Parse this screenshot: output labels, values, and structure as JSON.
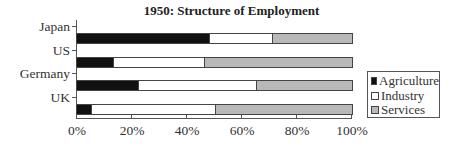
{
  "chart_data": {
    "type": "bar",
    "orientation": "horizontal",
    "stacked": "percent",
    "title": "1950:  Structure of Employment",
    "categories": [
      "Japan",
      "US",
      "Germany",
      "UK"
    ],
    "series": [
      {
        "name": "Agriculture",
        "color": "#111111",
        "values": [
          48,
          13,
          22,
          5
        ]
      },
      {
        "name": "Industry",
        "color": "#ffffff",
        "values": [
          23,
          33,
          43,
          45
        ]
      },
      {
        "name": "Services",
        "color": "#b8b8b8",
        "values": [
          29,
          54,
          35,
          50
        ]
      }
    ],
    "xlabel": "",
    "ylabel": "",
    "xlim": [
      0,
      100
    ],
    "xticks": [
      "0%",
      "20%",
      "40%",
      "60%",
      "80%",
      "100%"
    ],
    "grid": false,
    "legend_position": "right"
  },
  "title": "1950:  Structure of Employment",
  "categories": [
    "Japan",
    "US",
    "Germany",
    "UK"
  ],
  "xticks": [
    "0%",
    "20%",
    "40%",
    "60%",
    "80%",
    "100%"
  ],
  "legend": [
    {
      "label": "Agriculture",
      "color": "#111111"
    },
    {
      "label": "Industry",
      "color": "#ffffff"
    },
    {
      "label": "Services",
      "color": "#b8b8b8"
    }
  ]
}
